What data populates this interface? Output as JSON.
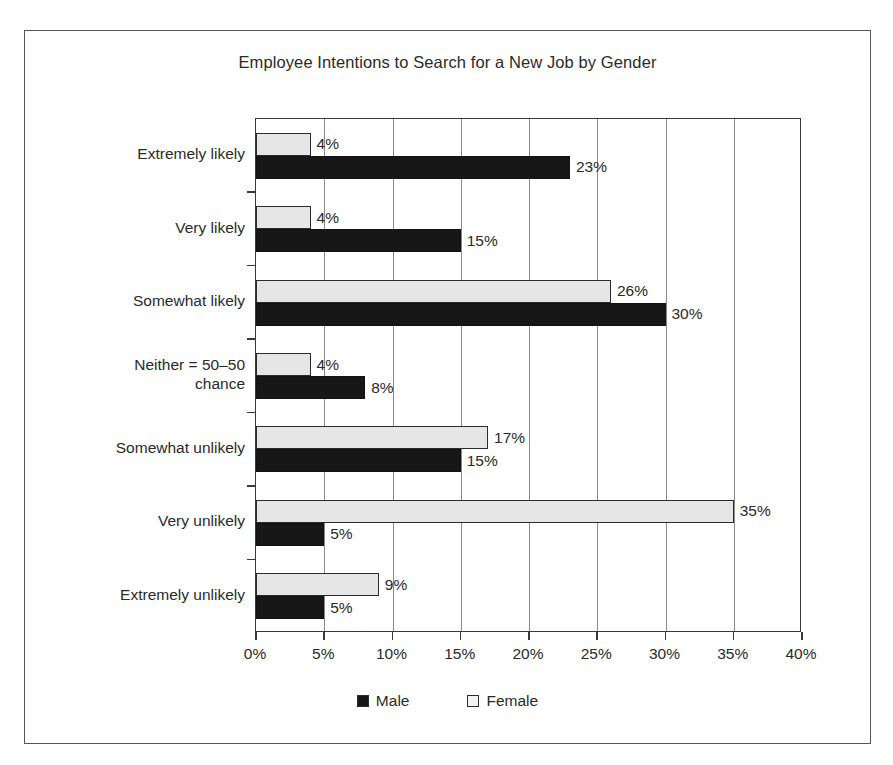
{
  "chart_data": {
    "type": "bar",
    "orientation": "horizontal",
    "title": "Employee Intentions to Search for a New Job by Gender",
    "xlabel": "",
    "ylabel": "",
    "xlim": [
      0,
      40
    ],
    "xticks": [
      0,
      5,
      10,
      15,
      20,
      25,
      30,
      35,
      40
    ],
    "xtick_labels": [
      "0%",
      "5%",
      "10%",
      "15%",
      "20%",
      "25%",
      "30%",
      "35%",
      "40%"
    ],
    "grid": "vertical",
    "legend_position": "bottom",
    "categories": [
      "Extremely likely",
      "Very likely",
      "Somewhat likely",
      "Neither = 50–50 chance",
      "Somewhat unlikely",
      "Very unlikely",
      "Extremely unlikely"
    ],
    "series": [
      {
        "name": "Male",
        "color": "#171717",
        "values": [
          23,
          15,
          30,
          8,
          15,
          5,
          5
        ],
        "value_labels": [
          "23%",
          "15%",
          "30%",
          "8%",
          "15%",
          "5%",
          "5%"
        ]
      },
      {
        "name": "Female",
        "color": "#e6e6e6",
        "values": [
          4,
          4,
          26,
          4,
          17,
          35,
          9
        ],
        "value_labels": [
          "4%",
          "4%",
          "26%",
          "4%",
          "17%",
          "35%",
          "9%"
        ]
      }
    ]
  },
  "legend": {
    "entries": [
      {
        "label": "Male",
        "swatch": "male"
      },
      {
        "label": "Female",
        "swatch": "female"
      }
    ]
  },
  "category_lines": [
    [
      "Extremely likely"
    ],
    [
      "Very likely"
    ],
    [
      "Somewhat likely"
    ],
    [
      "Neither = 50–50",
      "chance"
    ],
    [
      "Somewhat unlikely"
    ],
    [
      "Very unlikely"
    ],
    [
      "Extremely unlikely"
    ]
  ]
}
